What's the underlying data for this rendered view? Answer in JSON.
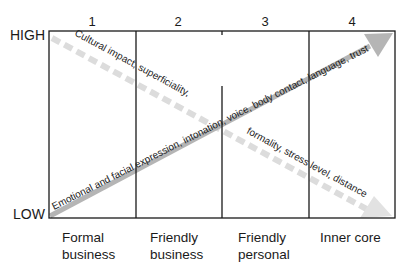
{
  "diagram": {
    "y_axis": {
      "high_label": "HIGH",
      "low_label": "LOW"
    },
    "columns": [
      {
        "number": "1",
        "label_line1": "Formal",
        "label_line2": "business"
      },
      {
        "number": "2",
        "label_line1": "Friendly",
        "label_line2": "business"
      },
      {
        "number": "3",
        "label_line1": "Friendly",
        "label_line2": "personal"
      },
      {
        "number": "4",
        "label_line1": "Inner core",
        "label_line2": ""
      }
    ],
    "arrows": {
      "increasing": {
        "direction": "low-to-high",
        "text": "Emotional and facial expression, intonation, voice, body contact, language, trust"
      },
      "decreasing": {
        "direction": "high-to-low",
        "text_upper": "Cultural impact, superficiality,",
        "text_lower": "formality, stress level, distance"
      }
    },
    "colors": {
      "line": "#1a1a1a",
      "solid_arrow": "#b3b3b3",
      "dashed_arrow": "#d9d9d9"
    }
  }
}
